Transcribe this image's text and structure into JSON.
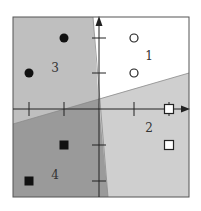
{
  "diagram": {
    "type": "four-class linear decision regions",
    "frame": {
      "x": 13,
      "y": 17,
      "width": 176,
      "height": 180
    },
    "origin": {
      "x": 99,
      "y": 109
    },
    "axes": {
      "x_ticks": [
        29,
        64,
        134,
        169
      ],
      "y_ticks": [
        38,
        73,
        145,
        181
      ]
    },
    "colors": {
      "region_1": "#ffffff",
      "region_2": "#cfcfcf",
      "region_3": "#bfbfbf",
      "region_4": "#9a9a9a",
      "ink": "#222222",
      "boundary": "#7a7a7a"
    },
    "boundaries": [
      {
        "name": "near-vertical",
        "from": [
          93,
          17
        ],
        "to": [
          108,
          197
        ]
      },
      {
        "name": "sloped",
        "from": [
          13,
          124
        ],
        "to": [
          189,
          73
        ]
      }
    ],
    "region_labels": [
      {
        "id": "1",
        "text": "1",
        "x": 149,
        "y": 60
      },
      {
        "id": "2",
        "text": "2",
        "x": 149,
        "y": 132
      },
      {
        "id": "3",
        "text": "3",
        "x": 55,
        "y": 72
      },
      {
        "id": "4",
        "text": "4",
        "x": 55,
        "y": 179
      }
    ],
    "points": {
      "filled_circles": [
        [
          64,
          38
        ],
        [
          29,
          73
        ]
      ],
      "open_circles": [
        [
          134,
          38
        ],
        [
          134,
          73
        ]
      ],
      "open_squares": [
        [
          169,
          109
        ],
        [
          169,
          145
        ]
      ],
      "filled_squares": [
        [
          64,
          145
        ],
        [
          29,
          181
        ]
      ]
    }
  }
}
